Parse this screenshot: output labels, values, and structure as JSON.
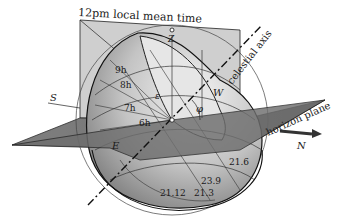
{
  "diagram": {
    "title_label": "12pm local mean time",
    "axis_label": "celestial axis",
    "plane_label": "horizon plane",
    "directions": {
      "south": "S",
      "north": "N",
      "east": "E",
      "west": "W",
      "zenith": "Z"
    },
    "angles": {
      "epsilon": "ε",
      "phi": "φ"
    },
    "hour_labels": [
      "9h",
      "8h",
      "7h",
      "6h"
    ],
    "date_labels": [
      "21.6",
      "23.9",
      "21.3",
      "21.12"
    ],
    "colors": {
      "horizon_plane": "#6b6b6b",
      "meridian_plane": "#c8c8c8",
      "sphere_light": "#d9d9d9",
      "sphere_dark": "#8a8a8a",
      "line": "#1a1a1a"
    }
  }
}
